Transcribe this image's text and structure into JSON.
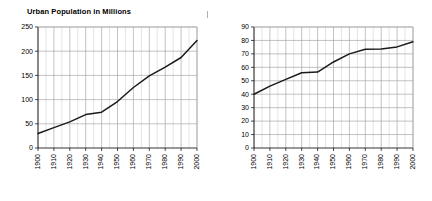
{
  "page": {
    "background_color": "#ffffff",
    "width": 432,
    "height": 201,
    "stray_mark_label": ""
  },
  "charts": [
    {
      "id": "urban-population",
      "title": "Urban Population in Millions"
    },
    {
      "id": "percent-urban",
      "title": "Percent Urban"
    }
  ],
  "chart_data": [
    {
      "type": "line",
      "title": "Urban Population in Millions",
      "xlabel": "",
      "ylabel": "",
      "x": [
        1900,
        1910,
        1920,
        1930,
        1940,
        1950,
        1960,
        1970,
        1980,
        1990,
        2000
      ],
      "values": [
        30,
        42,
        54,
        69,
        74,
        96,
        125,
        149,
        167,
        187,
        222
      ],
      "xlim": [
        1900,
        2000
      ],
      "ylim": [
        0,
        250
      ],
      "ytick_labels": [
        "0",
        "50",
        "100",
        "150",
        "200",
        "250"
      ],
      "yticks": [
        0,
        50,
        100,
        150,
        200,
        250
      ],
      "xtick_labels": [
        "1900",
        "1910",
        "1920",
        "1930",
        "1940",
        "1950",
        "1960",
        "1970",
        "1980",
        "1990",
        "2000"
      ],
      "grid": true,
      "grid_minor_step_x": 5,
      "legend": "none",
      "line_color": "#1a1a1a",
      "marker": "none"
    },
    {
      "type": "line",
      "title": "Percent Urban",
      "xlabel": "",
      "ylabel": "",
      "x": [
        1900,
        1910,
        1920,
        1930,
        1940,
        1950,
        1960,
        1970,
        1980,
        1990,
        2000
      ],
      "values": [
        40,
        46,
        51,
        56,
        56.5,
        64,
        70,
        73.5,
        73.7,
        75.2,
        79
      ],
      "xlim": [
        1900,
        2000
      ],
      "ylim": [
        0,
        90
      ],
      "ytick_labels": [
        "0",
        "10",
        "20",
        "30",
        "40",
        "50",
        "60",
        "70",
        "80",
        "90"
      ],
      "yticks": [
        0,
        10,
        20,
        30,
        40,
        50,
        60,
        70,
        80,
        90
      ],
      "xtick_labels": [
        "1900",
        "1910",
        "1920",
        "1930",
        "1940",
        "1950",
        "1960",
        "1970",
        "1980",
        "1990",
        "2000"
      ],
      "grid": true,
      "grid_minor_step_x": 5,
      "legend": "none",
      "line_color": "#1a1a1a",
      "marker": "none"
    }
  ]
}
